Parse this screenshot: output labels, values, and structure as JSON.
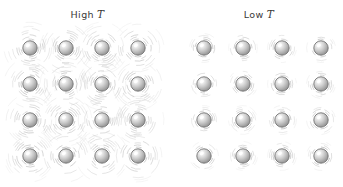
{
  "figure": {
    "background_color": "#ffffff",
    "width": 343,
    "height": 187
  },
  "panels": [
    {
      "id": "high-t",
      "label_prefix": "High",
      "label_symbol": "T",
      "grid_rows": 4,
      "grid_cols": 4,
      "atom_count": 16,
      "atom_radius": 7.2,
      "vibration_amplitude": "large",
      "arc_rings": 9,
      "arc_inner_radius": 9,
      "arc_outer_radius": 26,
      "origin_x": 30,
      "origin_y": 48,
      "spacing_x": 36,
      "spacing_y": 36
    },
    {
      "id": "low-t",
      "label_prefix": "Low",
      "label_symbol": "T",
      "grid_rows": 4,
      "grid_cols": 4,
      "atom_count": 16,
      "atom_radius": 7.2,
      "vibration_amplitude": "small",
      "arc_rings": 4,
      "arc_inner_radius": 9,
      "arc_outer_radius": 14.5,
      "origin_x": 29,
      "origin_y": 48,
      "spacing_x": 39,
      "spacing_y": 36
    }
  ],
  "colors": {
    "sphere_fill_light": "#f2f2f2",
    "sphere_fill_mid": "#c9c9c9",
    "sphere_fill_dark": "#9a9a9a",
    "sphere_outline": "#6e6e6e",
    "sphere_highlight": "#ffffff",
    "arc_stroke": "#b4b4b4",
    "label_text": "#3a3a3a",
    "background": "#ffffff"
  }
}
